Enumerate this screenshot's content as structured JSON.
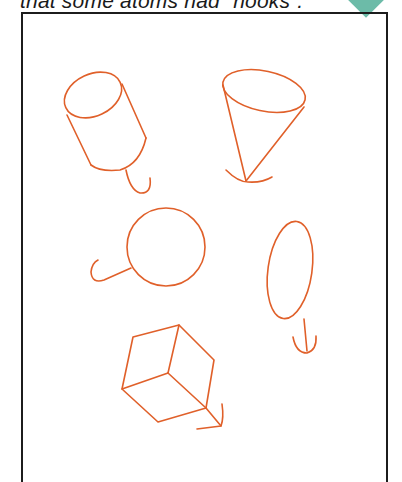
{
  "caption": {
    "text": "that some atoms had “hooks”."
  },
  "badge": {
    "color": "#6cbba8",
    "shape": "diamond"
  },
  "figure": {
    "ink_color": "#e0602a",
    "shapes": [
      {
        "name": "cylinder-with-hook",
        "label": "cylinder"
      },
      {
        "name": "cone-with-hook",
        "label": "cone"
      },
      {
        "name": "sphere-with-hook",
        "label": "sphere"
      },
      {
        "name": "ellipsoid-with-hook",
        "label": "ellipsoid"
      },
      {
        "name": "cube-with-hook",
        "label": "cube"
      }
    ]
  }
}
